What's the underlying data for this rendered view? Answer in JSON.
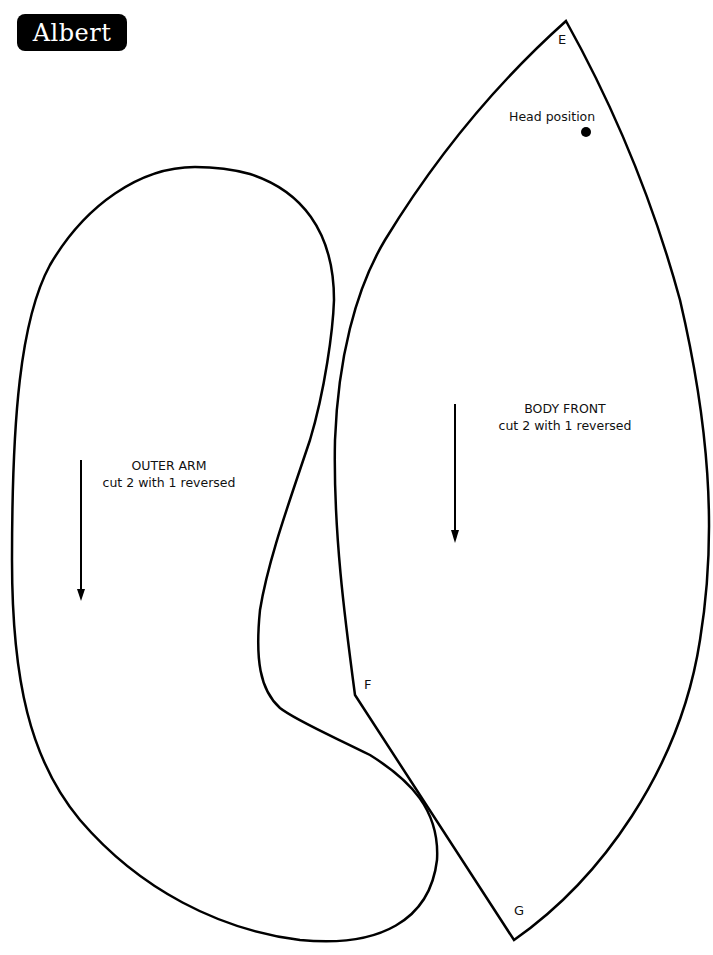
{
  "header": {
    "title": "Albert"
  },
  "pieces": [
    {
      "name": "OUTER ARM",
      "instruction": "cut 2 with 1 reversed",
      "grain_arrow": "down"
    },
    {
      "name": "BODY FRONT",
      "instruction": "cut 2 with 1 reversed",
      "grain_arrow": "down",
      "points": {
        "top": "E",
        "side": "F",
        "bottom": "G"
      },
      "markers": {
        "head": "Head position"
      }
    }
  ],
  "colors": {
    "ink": "#000000",
    "paper": "#ffffff"
  }
}
